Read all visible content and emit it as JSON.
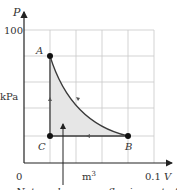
{
  "diagram": {
    "y_axis": {
      "symbol": "P",
      "unit": "kPa",
      "tick_top": "100"
    },
    "x_axis": {
      "symbol": "V",
      "unit": "m3",
      "unit_base": "m",
      "unit_exp": "3",
      "tick_origin": "0",
      "tick_right": "0.1"
    },
    "points": [
      {
        "name": "A",
        "V": 0.02,
        "P": 80
      },
      {
        "name": "B",
        "V": 0.08,
        "P": 20
      },
      {
        "name": "C",
        "V": 0.02,
        "P": 20
      }
    ],
    "process_labels": {
      "A": "A",
      "B": "B",
      "C": "C"
    },
    "cycle": [
      "A→B (curve)",
      "B→C (isobaric)",
      "C→A (isochoric)"
    ],
    "annotation": "Net work: energy flowing out of the",
    "colors": {
      "fill": "#e6e6e6",
      "line": "#3a3a3a",
      "grid": "#c8c8c8"
    }
  }
}
